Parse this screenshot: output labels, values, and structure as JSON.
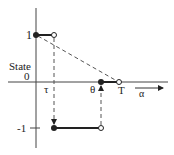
{
  "diagram": {
    "ylabel": "State",
    "y_ticks": [
      {
        "label": "1",
        "value": 1
      },
      {
        "label": "0",
        "value": 0
      },
      {
        "label": "-1",
        "value": -1
      }
    ],
    "x_markers": [
      {
        "label": "τ"
      },
      {
        "label": "θ"
      },
      {
        "label": "T"
      }
    ],
    "x_axis_label": "α",
    "colors": {
      "line": "#222222",
      "dashed": "#555555",
      "background": "#ffffff"
    }
  }
}
